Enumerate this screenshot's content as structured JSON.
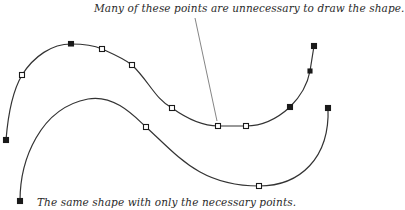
{
  "captions": {
    "top": "Many of these points are unnecessary to draw the shape.",
    "bottom": "The same shape with only the necessary points."
  },
  "colors": {
    "curve": "#333333",
    "point_fill": "#ffffff",
    "point_stroke": "#1a1a1a",
    "leader": "#777777",
    "text": "#2a2a2a"
  },
  "curves": {
    "redundant": {
      "label": "curve with many points",
      "points": [
        [
          6,
          140
        ],
        [
          22,
          75
        ],
        [
          71,
          44
        ],
        [
          102,
          49
        ],
        [
          132,
          65
        ],
        [
          172,
          108
        ],
        [
          218,
          126
        ],
        [
          246,
          126
        ],
        [
          290,
          107
        ],
        [
          310,
          71
        ],
        [
          314,
          46
        ]
      ]
    },
    "minimal": {
      "label": "curve with necessary points",
      "points": [
        [
          20,
          201
        ],
        [
          146,
          127
        ],
        [
          259,
          186
        ],
        [
          328,
          108
        ]
      ]
    }
  },
  "leader_line": {
    "from": [
      195,
      18
    ],
    "to": [
      217,
      121
    ]
  }
}
